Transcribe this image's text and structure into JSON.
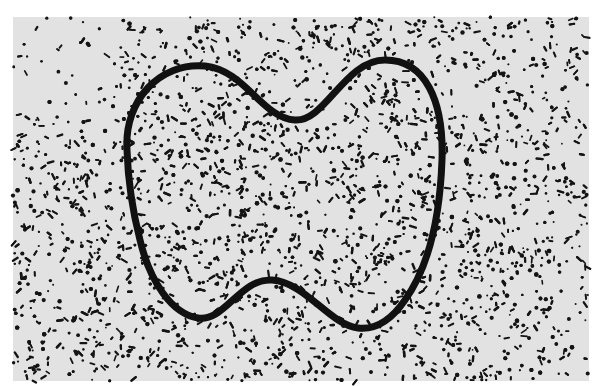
{
  "figure": {
    "field_box": {
      "x": 13,
      "y": 17,
      "width": 576,
      "height": 364
    },
    "colors": {
      "page": "#ffffff",
      "field": "#e2e2e2",
      "dots": "#141414",
      "outline": "#111111"
    },
    "outline_stroke_width": 7,
    "outline_path": "M127 150 C124 100 160 62 205 66 C245 70 262 118 295 120 C325 122 345 60 385 60 C425 60 444 100 442 160 C440 215 430 265 405 300 C390 322 375 330 358 328 C330 325 305 282 272 280 C240 278 225 322 198 318 C172 314 150 282 140 240 C131 205 128 180 127 150 Z",
    "dot_density": {
      "outer": 0.55,
      "inner": 1.0
    }
  }
}
